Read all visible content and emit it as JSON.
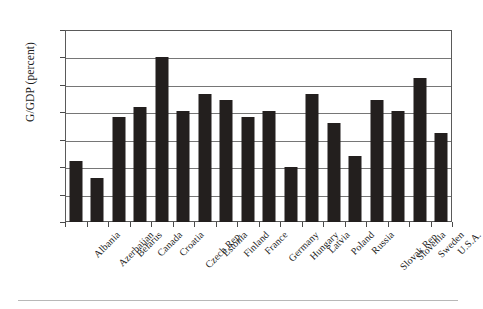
{
  "chart_data": {
    "type": "bar",
    "title": "",
    "xlabel": "",
    "ylabel": "G/GDP (percent)",
    "ylim": [
      0,
      35
    ],
    "ytick_step": 5,
    "yticks": [
      "35",
      "30",
      "25",
      "20",
      "15",
      "10",
      "5",
      "0"
    ],
    "grid": true,
    "legend": "none",
    "bar_color": "#231f1e",
    "categories": [
      "Albania",
      "Azerbaijan",
      "Belarus",
      "Canada",
      "Croatia",
      "Czech Rep.",
      "Estonia",
      "Finland",
      "France",
      "Germany",
      "Hungary",
      "Latvia",
      "Poland",
      "Russia",
      "Slovak Rep.",
      "Slovenia",
      "Sweden",
      "U.S.A."
    ],
    "values": [
      11.2,
      8.1,
      19.1,
      21.0,
      30.1,
      20.2,
      23.4,
      22.3,
      19.1,
      20.2,
      10.1,
      23.4,
      18.1,
      12.0,
      22.3,
      20.2,
      26.3,
      16.2
    ]
  }
}
